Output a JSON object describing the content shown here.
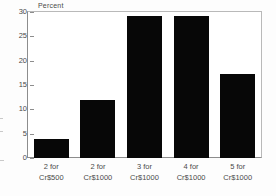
{
  "chart_data": {
    "type": "bar",
    "title": "",
    "subtitle": "",
    "ylabel": "Percent",
    "xlabel": "",
    "ylim": [
      0,
      30
    ],
    "yticks": [
      0,
      5,
      10,
      15,
      20,
      25,
      30
    ],
    "ytick_labels": [
      "0",
      "5",
      "10",
      "15",
      "20",
      "25",
      "30"
    ],
    "grid": false,
    "legend": null,
    "bar_color": "#070707",
    "categories": [
      "2 for Cr$500",
      "2 for Cr$1000",
      "3 for Cr$1000",
      "4 for Cr$1000",
      "5 for Cr$1000"
    ],
    "category_lines": [
      [
        "2 for",
        "Cr$500"
      ],
      [
        "2 for",
        "Cr$1000"
      ],
      [
        "3 for",
        "Cr$1000"
      ],
      [
        "4 for",
        "Cr$1000"
      ],
      [
        "5 for",
        "Cr$1000"
      ]
    ],
    "values": [
      4,
      12,
      29.2,
      29.2,
      17.2
    ]
  }
}
